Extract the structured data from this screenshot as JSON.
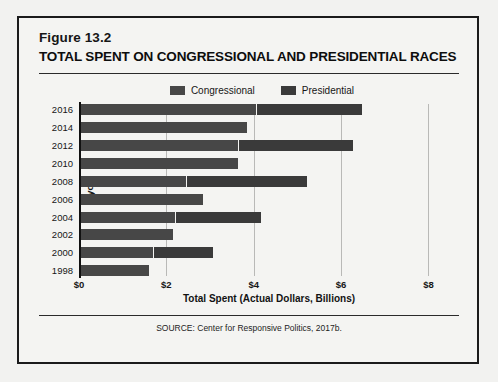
{
  "figure": {
    "number": "Figure 13.2",
    "title": "TOTAL SPENT ON CONGRESSIONAL AND PRESIDENTIAL RACES",
    "source": "SOURCE: Center for Responsive Politics, 2017b."
  },
  "colors": {
    "congressional": "#474747",
    "presidential": "#3a3a3a",
    "frame": "#1b1b1b",
    "gridline": "#b9b9b7",
    "axis": "#111111",
    "background": "#f4f4f2"
  },
  "chart_data": {
    "type": "bar",
    "orientation": "horizontal",
    "stacked": true,
    "title": "TOTAL SPENT ON CONGRESSIONAL AND PRESIDENTIAL RACES",
    "xlabel": "Total Spent (Actual Dollars, Billions)",
    "ylabel": "Cycle",
    "xlim": [
      0,
      8.7
    ],
    "xticks": [
      0,
      2,
      4,
      6,
      8
    ],
    "xticklabels": [
      "$0",
      "$2",
      "$4",
      "$6",
      "$8"
    ],
    "grid": "vertical",
    "legend_position": "top-center",
    "categories": [
      "2016",
      "2014",
      "2012",
      "2010",
      "2008",
      "2006",
      "2004",
      "2002",
      "2000",
      "1998"
    ],
    "series": [
      {
        "name": "Congressional",
        "color": "#474747",
        "values": [
          4.05,
          3.85,
          3.65,
          3.65,
          2.45,
          2.85,
          2.2,
          2.15,
          1.7,
          1.6
        ]
      },
      {
        "name": "Presidential",
        "color": "#3a3a3a",
        "values": [
          2.4,
          0,
          2.6,
          0,
          2.75,
          0,
          1.95,
          0,
          1.35,
          0
        ]
      }
    ],
    "totals": [
      6.45,
      3.85,
      6.25,
      3.65,
      5.2,
      2.85,
      4.15,
      2.15,
      3.05,
      1.6
    ]
  }
}
